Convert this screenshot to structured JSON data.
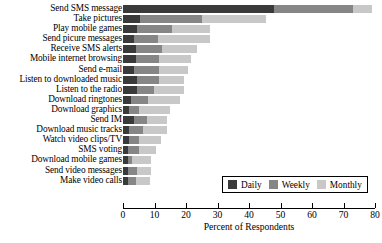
{
  "chart_data": {
    "type": "bar",
    "orientation": "horizontal",
    "stacked": true,
    "title": "",
    "xlabel": "Percent of Respondents",
    "ylabel": "",
    "xlim": [
      0,
      80
    ],
    "xticks": [
      0,
      10,
      20,
      30,
      40,
      50,
      60,
      70,
      80
    ],
    "grid": false,
    "legend_position": "bottom-right",
    "categories": [
      "Send SMS message",
      "Take pictures",
      "Play mobile games",
      "Send picure messages",
      "Receive SMS alerts",
      "Mobile internet browsing",
      "Send e-mail",
      "Listen to downloaded music",
      "Listen to the radio",
      "Download ringtones",
      "Download graphics",
      "Send IM",
      "Download music tracks",
      "Watch video clips/TV",
      "SMS voting",
      "Download mobile games",
      "Send video messages",
      "Make video calls"
    ],
    "series": [
      {
        "name": "Daily",
        "color": "#3a3a3a",
        "values": [
          48.0,
          5.5,
          4.5,
          3.5,
          4.0,
          4.0,
          3.5,
          4.5,
          4.5,
          2.5,
          2.0,
          3.5,
          2.0,
          2.0,
          1.5,
          1.5,
          1.5,
          1.5
        ]
      },
      {
        "name": "Weekly",
        "color": "#868686",
        "values": [
          25.0,
          19.5,
          11.0,
          7.5,
          8.5,
          7.5,
          8.0,
          7.0,
          5.5,
          5.5,
          3.0,
          4.0,
          4.5,
          3.0,
          3.5,
          1.5,
          3.0,
          2.5
        ]
      },
      {
        "name": "Monthly",
        "color": "#c8c8c8",
        "values": [
          6.0,
          20.5,
          12.0,
          16.5,
          11.0,
          10.0,
          9.0,
          8.0,
          9.5,
          10.0,
          10.0,
          6.5,
          7.5,
          7.0,
          5.5,
          6.0,
          4.5,
          4.5
        ]
      }
    ],
    "totals": [
      79.0,
      45.5,
      27.5,
      27.5,
      23.5,
      21.5,
      20.5,
      19.5,
      19.5,
      18.0,
      15.0,
      14.0,
      14.0,
      12.0,
      10.5,
      9.0,
      9.0,
      8.5
    ]
  },
  "legend": {
    "items": [
      {
        "label": "Daily",
        "color": "#3a3a3a"
      },
      {
        "label": "Weekly",
        "color": "#868686"
      },
      {
        "label": "Monthly",
        "color": "#c8c8c8"
      }
    ]
  }
}
